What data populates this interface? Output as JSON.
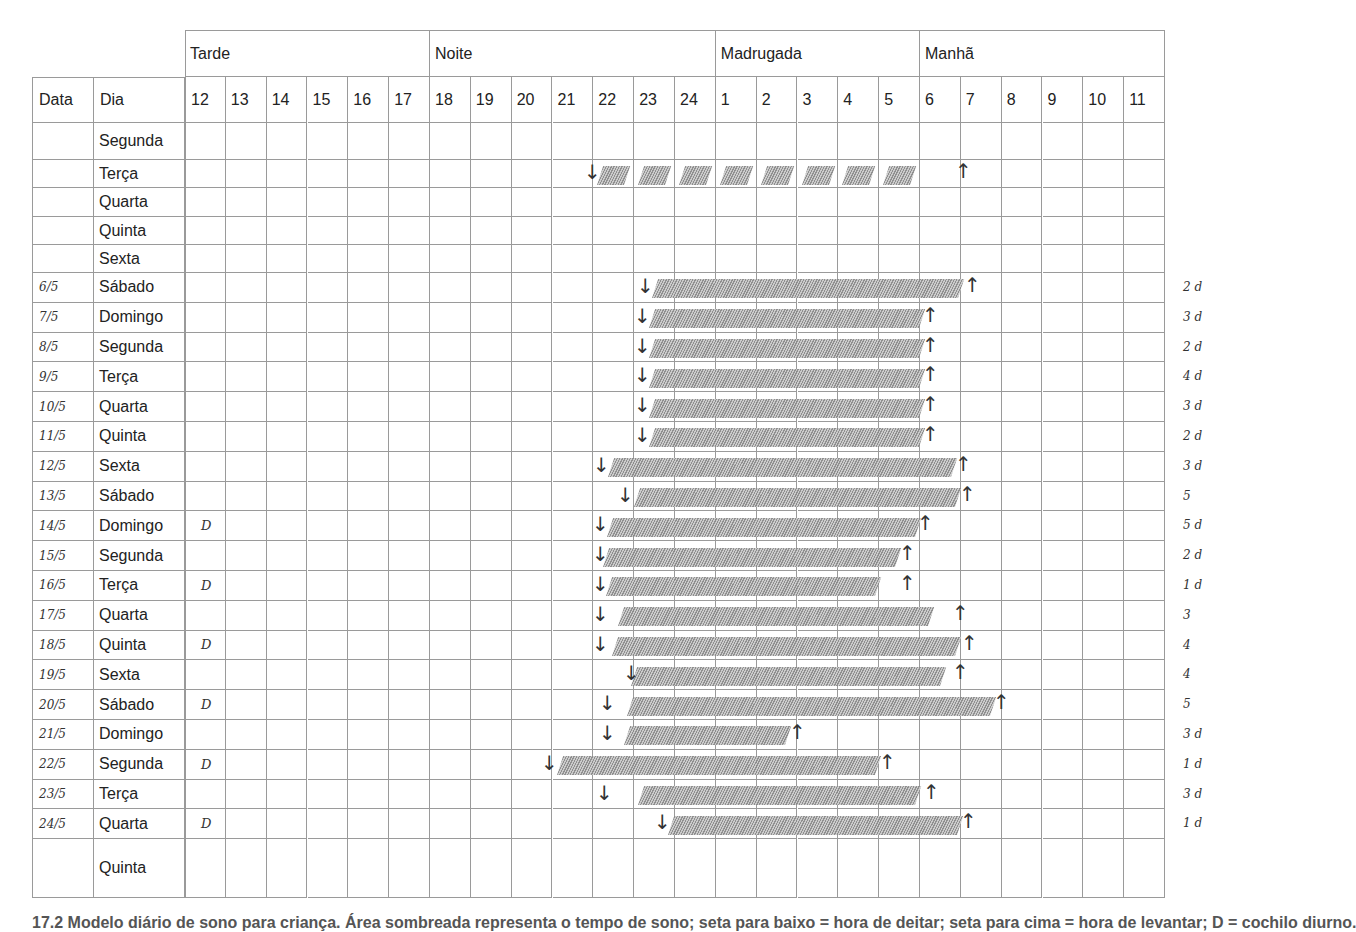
{
  "header": {
    "periods": [
      {
        "label": "Tarde",
        "start_col": 0,
        "span": 6
      },
      {
        "label": "Noite",
        "start_col": 6,
        "span": 7
      },
      {
        "label": "Madrugada",
        "start_col": 13,
        "span": 5
      },
      {
        "label": "Manhã",
        "start_col": 18,
        "span": 6
      }
    ],
    "data_label": "Data",
    "dia_label": "Dia",
    "hours": [
      "12",
      "13",
      "14",
      "15",
      "16",
      "17",
      "18",
      "19",
      "20",
      "21",
      "22",
      "23",
      "24",
      "1",
      "2",
      "3",
      "4",
      "5",
      "6",
      "7",
      "8",
      "9",
      "10",
      "11"
    ]
  },
  "rows": [
    {
      "date": "",
      "dia": "Segunda",
      "mark": "",
      "note": "",
      "sleep": null
    },
    {
      "date": "",
      "dia": "Terça",
      "mark": "",
      "note": "",
      "sleep": {
        "down_x": 590,
        "bar": [
          597,
          918
        ],
        "up_x": 961,
        "dashed": true
      }
    },
    {
      "date": "",
      "dia": "Quarta",
      "mark": "",
      "note": "",
      "sleep": null
    },
    {
      "date": "",
      "dia": "Quinta",
      "mark": "",
      "note": "",
      "sleep": null
    },
    {
      "date": "",
      "dia": "Sexta",
      "mark": "",
      "note": "",
      "sleep": null
    },
    {
      "date": "6/5",
      "dia": "Sábado",
      "mark": "",
      "note": "2 d",
      "sleep": {
        "down_x": 643,
        "bar": [
          652,
          958
        ],
        "up_x": 970
      }
    },
    {
      "date": "7/5",
      "dia": "Domingo",
      "mark": "",
      "note": "3 d",
      "sleep": {
        "down_x": 640,
        "bar": [
          649,
          919
        ],
        "up_x": 928
      }
    },
    {
      "date": "8/5",
      "dia": "Segunda",
      "mark": "",
      "note": "2 d",
      "sleep": {
        "down_x": 640,
        "bar": [
          649,
          919
        ],
        "up_x": 928
      }
    },
    {
      "date": "9/5",
      "dia": "Terça",
      "mark": "",
      "note": "4 d",
      "sleep": {
        "down_x": 640,
        "bar": [
          649,
          919
        ],
        "up_x": 928
      }
    },
    {
      "date": "10/5",
      "dia": "Quarta",
      "mark": "",
      "note": "3 d",
      "sleep": {
        "down_x": 640,
        "bar": [
          649,
          919
        ],
        "up_x": 928
      }
    },
    {
      "date": "11/5",
      "dia": "Quinta",
      "mark": "",
      "note": "2 d",
      "sleep": {
        "down_x": 640,
        "bar": [
          649,
          919
        ],
        "up_x": 928
      }
    },
    {
      "date": "12/5",
      "dia": "Sexta",
      "mark": "",
      "note": "3 d",
      "sleep": {
        "down_x": 599,
        "bar": [
          608,
          951
        ],
        "up_x": 961
      }
    },
    {
      "date": "13/5",
      "dia": "Sábado",
      "mark": "",
      "note": "5",
      "sleep": {
        "down_x": 623,
        "bar": [
          634,
          955
        ],
        "up_x": 965
      }
    },
    {
      "date": "14/5",
      "dia": "Domingo",
      "mark": "D",
      "note": "5 d",
      "sleep": {
        "down_x": 598,
        "bar": [
          607,
          915
        ],
        "up_x": 923
      }
    },
    {
      "date": "15/5",
      "dia": "Segunda",
      "mark": "",
      "note": "2 d",
      "sleep": {
        "down_x": 598,
        "bar": [
          603,
          895
        ],
        "up_x": 905
      }
    },
    {
      "date": "16/5",
      "dia": "Terça",
      "mark": "D",
      "note": "1 d",
      "sleep": {
        "down_x": 598,
        "bar": [
          606,
          875
        ],
        "up_x": 905
      }
    },
    {
      "date": "17/5",
      "dia": "Quarta",
      "mark": "",
      "note": "3",
      "sleep": {
        "down_x": 598,
        "bar": [
          618,
          928
        ],
        "up_x": 958
      }
    },
    {
      "date": "18/5",
      "dia": "Quinta",
      "mark": "D",
      "note": "4",
      "sleep": {
        "down_x": 598,
        "bar": [
          612,
          955
        ],
        "up_x": 967
      }
    },
    {
      "date": "19/5",
      "dia": "Sexta",
      "mark": "",
      "note": "4",
      "sleep": {
        "down_x": 629,
        "bar": [
          631,
          940
        ],
        "up_x": 958
      }
    },
    {
      "date": "20/5",
      "dia": "Sábado",
      "mark": "D",
      "note": "5",
      "sleep": {
        "down_x": 605,
        "bar": [
          627,
          990
        ],
        "up_x": 999
      }
    },
    {
      "date": "21/5",
      "dia": "Domingo",
      "mark": "",
      "note": "3 d",
      "sleep": {
        "down_x": 605,
        "bar": [
          624,
          785
        ],
        "up_x": 795
      }
    },
    {
      "date": "22/5",
      "dia": "Segunda",
      "mark": "D",
      "note": "1 d",
      "sleep": {
        "down_x": 547,
        "bar": [
          557,
          875
        ],
        "up_x": 885
      }
    },
    {
      "date": "23/5",
      "dia": "Terça",
      "mark": "",
      "note": "3 d",
      "sleep": {
        "down_x": 602,
        "bar": [
          638,
          915
        ],
        "up_x": 929
      }
    },
    {
      "date": "24/5",
      "dia": "Quarta",
      "mark": "D",
      "note": "1 d",
      "sleep": {
        "down_x": 660,
        "bar": [
          668,
          957
        ],
        "up_x": 966
      }
    },
    {
      "date": "",
      "dia": "Quinta",
      "mark": "",
      "note": "",
      "sleep": null
    }
  ],
  "symbols": {
    "down": "↓",
    "up": "↑"
  },
  "caption": "17.2  Modelo diário de sono para criança. Área sombreada representa o tempo de sono; seta para baixo = hora de deitar; seta para cima = hora de levantar; D = cochilo diurno."
}
